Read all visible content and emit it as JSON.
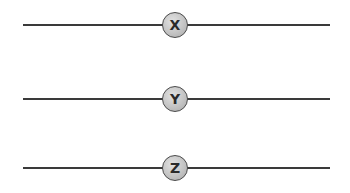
{
  "diagram": {
    "nodes": [
      {
        "label": "X"
      },
      {
        "label": "Y"
      },
      {
        "label": "Z"
      }
    ],
    "colors": {
      "line": "#3a3a3a",
      "node_fill": "#c4c4c4",
      "node_border": "#4a4a4a",
      "label": "#2a2a2a"
    }
  }
}
